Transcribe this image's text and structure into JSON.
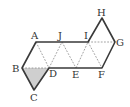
{
  "diagram": {
    "title": "",
    "labels": {
      "A": "A",
      "B": "B",
      "C": "C",
      "D": "D",
      "E": "E",
      "F": "F",
      "G": "G",
      "H": "H",
      "I": "I",
      "J": "J"
    },
    "points": {
      "A": [
        36,
        42
      ],
      "J": [
        62,
        42
      ],
      "I": [
        88,
        42
      ],
      "G": [
        115,
        42
      ],
      "H": [
        102,
        18
      ],
      "B": [
        22,
        68
      ],
      "D": [
        49,
        68
      ],
      "E": [
        76,
        68
      ],
      "F": [
        102,
        68
      ],
      "C": [
        34,
        90
      ]
    },
    "shaded_triangle": [
      "B",
      "D",
      "C"
    ],
    "shade_color": "#cfcfcf",
    "solid_edges": [
      [
        "A",
        "I"
      ],
      [
        "I",
        "H"
      ],
      [
        "H",
        "G"
      ],
      [
        "G",
        "F"
      ],
      [
        "F",
        "D"
      ],
      [
        "D",
        "C"
      ],
      [
        "C",
        "B"
      ],
      [
        "B",
        "A"
      ]
    ],
    "dashed_edges": [
      [
        "A",
        "D"
      ],
      [
        "D",
        "J"
      ],
      [
        "J",
        "E"
      ],
      [
        "E",
        "I"
      ],
      [
        "I",
        "F"
      ],
      [
        "I",
        "G"
      ],
      [
        "B",
        "D"
      ]
    ]
  }
}
